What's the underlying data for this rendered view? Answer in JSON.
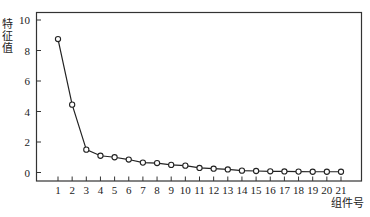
{
  "chart_data": {
    "type": "line",
    "title": "",
    "xlabel": "组件号",
    "ylabel": "特征值",
    "x": [
      1,
      2,
      3,
      4,
      5,
      6,
      7,
      8,
      9,
      10,
      11,
      12,
      13,
      14,
      15,
      16,
      17,
      18,
      19,
      20,
      21
    ],
    "series": [
      {
        "name": "特征值",
        "values": [
          8.75,
          4.45,
          1.5,
          1.1,
          1.0,
          0.85,
          0.65,
          0.62,
          0.5,
          0.45,
          0.3,
          0.25,
          0.2,
          0.12,
          0.1,
          0.08,
          0.07,
          0.06,
          0.05,
          0.05,
          0.05
        ],
        "marker": "open-circle",
        "color": "#222222"
      }
    ],
    "xticks": [
      "1",
      "2",
      "3",
      "4",
      "5",
      "6",
      "7",
      "8",
      "9",
      "10",
      "11",
      "12",
      "13",
      "14",
      "15",
      "16",
      "17",
      "18",
      "19",
      "20",
      "21"
    ],
    "yticks": [
      0,
      2,
      4,
      6,
      8,
      10
    ],
    "ylim": [
      0,
      10.5
    ],
    "xlim": [
      -0.5,
      22.5
    ],
    "grid": false,
    "legend": "none"
  }
}
